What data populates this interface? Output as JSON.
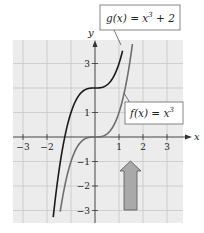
{
  "figure": {
    "x_axis_label": "x",
    "y_axis_label": "y",
    "x_ticks": [
      {
        "value": -3,
        "label": "−3"
      },
      {
        "value": -2,
        "label": "−2"
      },
      {
        "value": 1,
        "label": "1"
      },
      {
        "value": 2,
        "label": "2"
      },
      {
        "value": 3,
        "label": "3"
      }
    ],
    "y_ticks": [
      {
        "value": 3,
        "label": "3"
      },
      {
        "value": 1,
        "label": "1"
      },
      {
        "value": -1,
        "label": "−1"
      },
      {
        "value": -2,
        "label": "−2"
      },
      {
        "value": -3,
        "label": "−3"
      }
    ],
    "callouts": {
      "g": {
        "prefix": "g(x) = x",
        "exp": "3",
        "suffix": " + 2"
      },
      "f": {
        "prefix": "f(x) = x",
        "exp": "3",
        "suffix": ""
      }
    },
    "colors": {
      "grid_bg": "#ececec",
      "grid_line": "#c8c8c8",
      "axis": "#333333",
      "g_curve": "#1a1a1a",
      "f_curve": "#6e6e6e",
      "arrow_fill": "#a9a9a9",
      "arrow_stroke": "#555555"
    },
    "arrow": {
      "direction": "up",
      "meaning": "vertical shift up 2 units"
    }
  },
  "chart_data": {
    "type": "line",
    "title": "",
    "xlabel": "x",
    "ylabel": "y",
    "xlim": [
      -3.5,
      3.7
    ],
    "ylim": [
      -3.5,
      3.9
    ],
    "grid": true,
    "series": [
      {
        "name": "g(x) = x^3 + 2",
        "expression": "x^3 + 2",
        "x": [
          -1.7,
          -1.5,
          -1.0,
          -0.5,
          0,
          0.5,
          1.0,
          1.2
        ],
        "y": [
          -2.91,
          -1.38,
          1.0,
          1.88,
          2.0,
          2.13,
          3.0,
          3.73
        ]
      },
      {
        "name": "f(x) = x^3",
        "expression": "x^3",
        "x": [
          -1.5,
          -1.0,
          -0.5,
          0,
          0.5,
          1.0,
          1.5
        ],
        "y": [
          -3.38,
          -1.0,
          -0.13,
          0,
          0.13,
          1.0,
          3.38
        ]
      }
    ],
    "annotations": [
      "g(x) = x^3 + 2",
      "f(x) = x^3",
      "upward arrow indicating vertical translation"
    ]
  }
}
